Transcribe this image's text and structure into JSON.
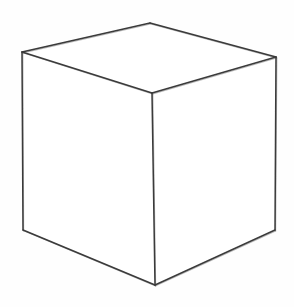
{
  "drawing": {
    "subject": "cube",
    "style": "pencil sketch",
    "background": "#fefefe",
    "stroke_color": "#3a3a3a",
    "stroke_color_light": "#8a8a8a",
    "vertices": {
      "top_back": [
        150,
        23
      ],
      "top_left": [
        22,
        52
      ],
      "top_right": [
        276,
        57
      ],
      "front_top": [
        152,
        93
      ],
      "bottom_left": [
        23,
        230
      ],
      "bottom_front": [
        155,
        285
      ],
      "bottom_right": [
        275,
        230
      ]
    },
    "faces": [
      "top",
      "left",
      "right"
    ]
  }
}
